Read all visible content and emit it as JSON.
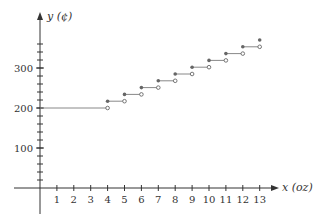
{
  "chart_data": {
    "type": "line",
    "subtype": "step",
    "title": "",
    "xlabel": "x (oz)",
    "ylabel": "y (¢)",
    "x_ticks": [
      1,
      2,
      3,
      4,
      5,
      6,
      7,
      8,
      9,
      10,
      11,
      12,
      13
    ],
    "y_tick_labels": [
      100,
      200,
      300
    ],
    "y_minor_tick_step": 20,
    "xlim": [
      0,
      13.5
    ],
    "ylim": [
      0,
      370
    ],
    "grid": false,
    "legend": null,
    "segments": [
      {
        "x_start": 0,
        "x_end": 4,
        "y": 200,
        "start": "none",
        "end": "open"
      },
      {
        "x_start": 4,
        "x_end": 5,
        "y": 217,
        "start": "closed",
        "end": "open"
      },
      {
        "x_start": 5,
        "x_end": 6,
        "y": 234,
        "start": "closed",
        "end": "open"
      },
      {
        "x_start": 6,
        "x_end": 7,
        "y": 251,
        "start": "closed",
        "end": "open"
      },
      {
        "x_start": 7,
        "x_end": 8,
        "y": 268,
        "start": "closed",
        "end": "open"
      },
      {
        "x_start": 8,
        "x_end": 9,
        "y": 285,
        "start": "closed",
        "end": "open"
      },
      {
        "x_start": 9,
        "x_end": 10,
        "y": 302,
        "start": "closed",
        "end": "open"
      },
      {
        "x_start": 10,
        "x_end": 11,
        "y": 319,
        "start": "closed",
        "end": "open"
      },
      {
        "x_start": 11,
        "x_end": 12,
        "y": 336,
        "start": "closed",
        "end": "open"
      },
      {
        "x_start": 12,
        "x_end": 13,
        "y": 353,
        "start": "closed",
        "end": "open"
      },
      {
        "x_start": 13,
        "x_end": 13,
        "y": 370,
        "start": "closed",
        "end": "none"
      }
    ]
  },
  "colors": {
    "axis": "#333333",
    "line": "#888888",
    "point": "#666666"
  }
}
